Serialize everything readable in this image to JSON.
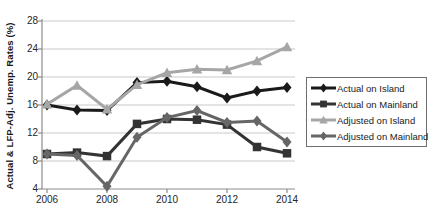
{
  "chart_data": {
    "type": "line",
    "title": "",
    "xlabel": "",
    "ylabel": "Actual & LFP-Adj. Unemp. Rates (%)",
    "x": [
      2006,
      2007,
      2008,
      2009,
      2010,
      2011,
      2012,
      2013,
      2014
    ],
    "x_tick_labels": [
      "2006",
      "2008",
      "2010",
      "2012",
      "2014"
    ],
    "y_ticks": [
      4,
      8,
      12,
      16,
      20,
      24,
      28
    ],
    "ylim": [
      4,
      28
    ],
    "grid": true,
    "legend_position": "right",
    "series": [
      {
        "name": "Actual on Island",
        "marker": "diamond",
        "color": "#1a1a1a",
        "values": [
          16.0,
          15.3,
          15.2,
          19.2,
          19.4,
          18.6,
          17.0,
          18.0,
          18.5
        ]
      },
      {
        "name": "Actual on Mainland",
        "marker": "square",
        "color": "#333333",
        "values": [
          9.0,
          9.2,
          8.7,
          13.3,
          14.0,
          13.9,
          13.2,
          10.0,
          9.1
        ]
      },
      {
        "name": "Adjusted on Island",
        "marker": "triangle",
        "color": "#a6a6a6",
        "values": [
          16.1,
          18.8,
          15.4,
          18.9,
          20.6,
          21.1,
          21.0,
          22.3,
          24.3
        ]
      },
      {
        "name": "Adjusted on Mainland",
        "marker": "diamond",
        "color": "#666666",
        "values": [
          9.0,
          8.8,
          4.4,
          11.4,
          14.2,
          15.2,
          13.5,
          13.7,
          10.7
        ]
      }
    ],
    "style": {
      "grid_color": "#c9c9c9",
      "axis_color": "#8c8c8c",
      "background": "#ffffff"
    }
  }
}
